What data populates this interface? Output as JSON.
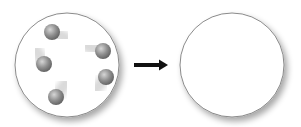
{
  "diagram": {
    "title": "",
    "left_container": {
      "label": "",
      "particle_count": 5,
      "particles": [
        {
          "cx": 52,
          "cy": 32,
          "tail_dx": 14,
          "tail_dy": 6
        },
        {
          "cx": 103,
          "cy": 51,
          "tail_dx": -16,
          "tail_dy": -5
        },
        {
          "cx": 44,
          "cy": 64,
          "tail_dx": -8,
          "tail_dy": -14
        },
        {
          "cx": 106,
          "cy": 77,
          "tail_dx": -10,
          "tail_dy": 12
        },
        {
          "cx": 56,
          "cy": 97,
          "tail_dx": 10,
          "tail_dy": -14
        }
      ]
    },
    "arrow": {
      "direction": "right"
    },
    "right_container": {
      "label": "",
      "particle_count": 0
    },
    "colors": {
      "container_stroke": "#8a8a8a",
      "container_fill": "#ffffff",
      "particle": "#8c8c8c",
      "arrow": "#111111"
    }
  }
}
